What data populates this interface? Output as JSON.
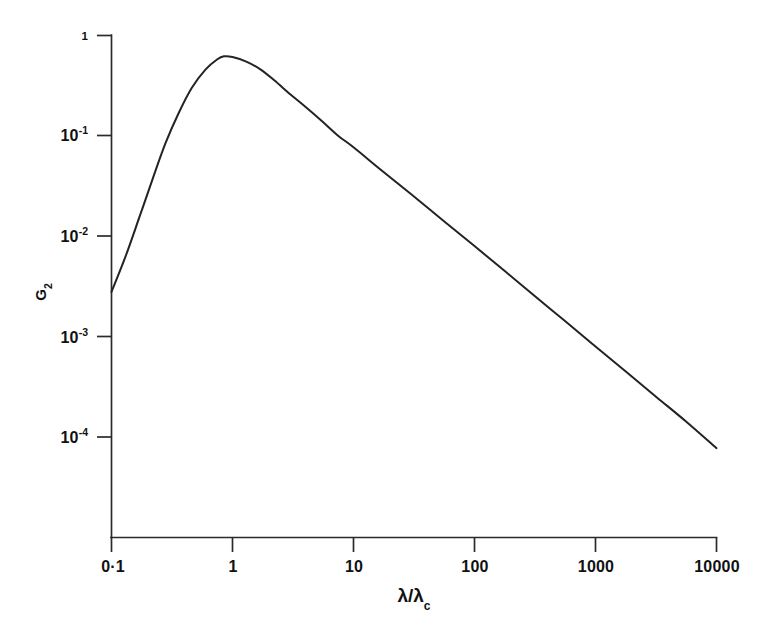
{
  "figure": {
    "background_color": "#ffffff",
    "ink_color": "#232323",
    "width": 775,
    "height": 631
  },
  "chart_data": {
    "type": "line",
    "title": "",
    "subtitle": "",
    "xlabel": "λ/λ_c",
    "xlabel_main": "λ/λ",
    "xlabel_sub": "c",
    "ylabel": "G_2",
    "ylabel_main": "G",
    "ylabel_sub": "2",
    "xscale": "log",
    "yscale": "log",
    "xlim": [
      0.1,
      10000
    ],
    "ylim": [
      1e-05,
      1
    ],
    "grid": false,
    "legend": null,
    "legend_position": "none",
    "xticks": [
      {
        "value": 0.1,
        "label": "0·1"
      },
      {
        "value": 1,
        "label": "1"
      },
      {
        "value": 10,
        "label": "10"
      },
      {
        "value": 100,
        "label": "100"
      },
      {
        "value": 1000,
        "label": "1000"
      },
      {
        "value": 10000,
        "label": "10000"
      }
    ],
    "yticks": [
      {
        "value": 1,
        "mantissa": "1",
        "exponent": "",
        "label": "1"
      },
      {
        "value": 0.1,
        "mantissa": "10",
        "exponent": "-1",
        "label": "10^-1"
      },
      {
        "value": 0.01,
        "mantissa": "10",
        "exponent": "-2",
        "label": "10^-2"
      },
      {
        "value": 0.001,
        "mantissa": "10",
        "exponent": "-3",
        "label": "10^-3"
      },
      {
        "value": 0.0001,
        "mantissa": "10",
        "exponent": "-4",
        "label": "10^-4"
      }
    ],
    "series": [
      {
        "name": "G2",
        "color": "#232323",
        "x": [
          0.1,
          0.13,
          0.17,
          0.22,
          0.28,
          0.36,
          0.46,
          0.6,
          0.75,
          0.85,
          1.0,
          1.3,
          1.7,
          2.2,
          3.0,
          4.0,
          5.5,
          7.5,
          10,
          17,
          30,
          55,
          100,
          180,
          320,
          560,
          1000,
          1800,
          3200,
          5600,
          10000
        ],
        "y": [
          0.0028,
          0.0062,
          0.0155,
          0.038,
          0.085,
          0.17,
          0.3,
          0.46,
          0.58,
          0.62,
          0.61,
          0.55,
          0.46,
          0.36,
          0.26,
          0.195,
          0.14,
          0.1,
          0.077,
          0.0455,
          0.0262,
          0.0144,
          0.008,
          0.00445,
          0.0025,
          0.00143,
          0.0008,
          0.000445,
          0.00025,
          0.000143,
          7.75e-05
        ]
      }
    ]
  },
  "accessibility": {
    "description": "Log-log plot of G2 against lambda over lambda_c"
  }
}
